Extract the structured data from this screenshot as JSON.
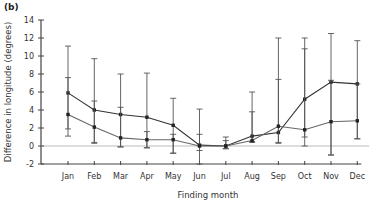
{
  "panel_label": "(b)",
  "chart_data": {
    "type": "line",
    "title": "",
    "xlabel": "Finding month",
    "ylabel": "Difference in longitude (degrees)",
    "ylim": [
      -2,
      14
    ],
    "yticks": [
      -2,
      0,
      2,
      4,
      6,
      8,
      10,
      12,
      14
    ],
    "categories": [
      "Jan",
      "Feb",
      "Mar",
      "Apr",
      "May",
      "Jun",
      "Jul",
      "Aug",
      "Sep",
      "Oct",
      "Nov",
      "Dec"
    ],
    "grid": false,
    "reference_line": 0,
    "series": [
      {
        "name": "series-upper",
        "values": [
          5.9,
          4.0,
          3.5,
          3.2,
          2.3,
          0.1,
          0.0,
          1.1,
          1.5,
          5.2,
          7.1,
          6.9
        ],
        "err_high": [
          11.1,
          9.7,
          8.0,
          8.1,
          5.3,
          4.1,
          1.0,
          6.0,
          12.0,
          12.0,
          12.5,
          11.7
        ],
        "err_low": [
          1.9,
          0.4,
          -0.1,
          -0.2,
          -0.8,
          -2.0,
          -0.3,
          0.4,
          0.3,
          0.0,
          -1.0,
          0.8
        ]
      },
      {
        "name": "series-lower",
        "values": [
          3.5,
          2.1,
          0.9,
          0.7,
          0.7,
          0.0,
          0.0,
          0.6,
          2.2,
          1.8,
          2.7,
          2.8
        ],
        "err_high": [
          7.6,
          5.0,
          4.3,
          1.6,
          1.3,
          1.3,
          0.6,
          3.8,
          7.4,
          10.8,
          7.3,
          6.9
        ],
        "err_low": [
          1.1,
          0.3,
          -0.1,
          -0.2,
          -0.8,
          -0.5,
          -0.3,
          0.5,
          0.4,
          1.0,
          -1.0,
          0.8
        ]
      }
    ]
  }
}
